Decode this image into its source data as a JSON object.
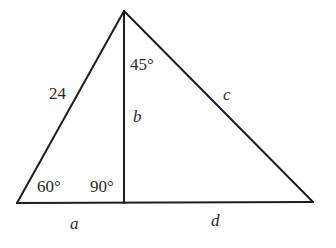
{
  "diagram": {
    "type": "triangle-with-altitude",
    "stroke_color": "#1e1e1e",
    "label_color": "#2a2a2a",
    "vertices": {
      "apex": [
        124,
        11
      ],
      "bottom_left": [
        17,
        203
      ],
      "altitude_foot": [
        124,
        203
      ],
      "bottom_right": [
        313,
        202
      ]
    },
    "labels": {
      "left_side": "24",
      "top_angle": "45°",
      "altitude": "b",
      "right_side": "c",
      "left_angle": "60°",
      "right_angle": "90°",
      "base_left": "a",
      "base_right": "d"
    }
  }
}
